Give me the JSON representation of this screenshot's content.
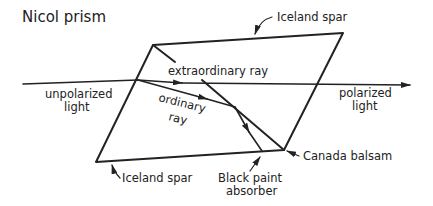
{
  "title": "Nicol prism",
  "labels": {
    "iceland_spar_top": "Iceland spar",
    "iceland_spar_bottom": "Iceland spar",
    "unpolarized_1": "unpolarized",
    "unpolarized_2": "light",
    "polarized_1": "polarized",
    "polarized_2": "light",
    "extraordinary": "extraordinary ray",
    "ordinary_1": "ordinary",
    "ordinary_2": "ray",
    "canada_balsam": "Canada balsam",
    "black_paint_1": "Black paint",
    "black_paint_2": "absorber"
  },
  "colors": {
    "ink": "#222222",
    "background": "#ffffff"
  }
}
